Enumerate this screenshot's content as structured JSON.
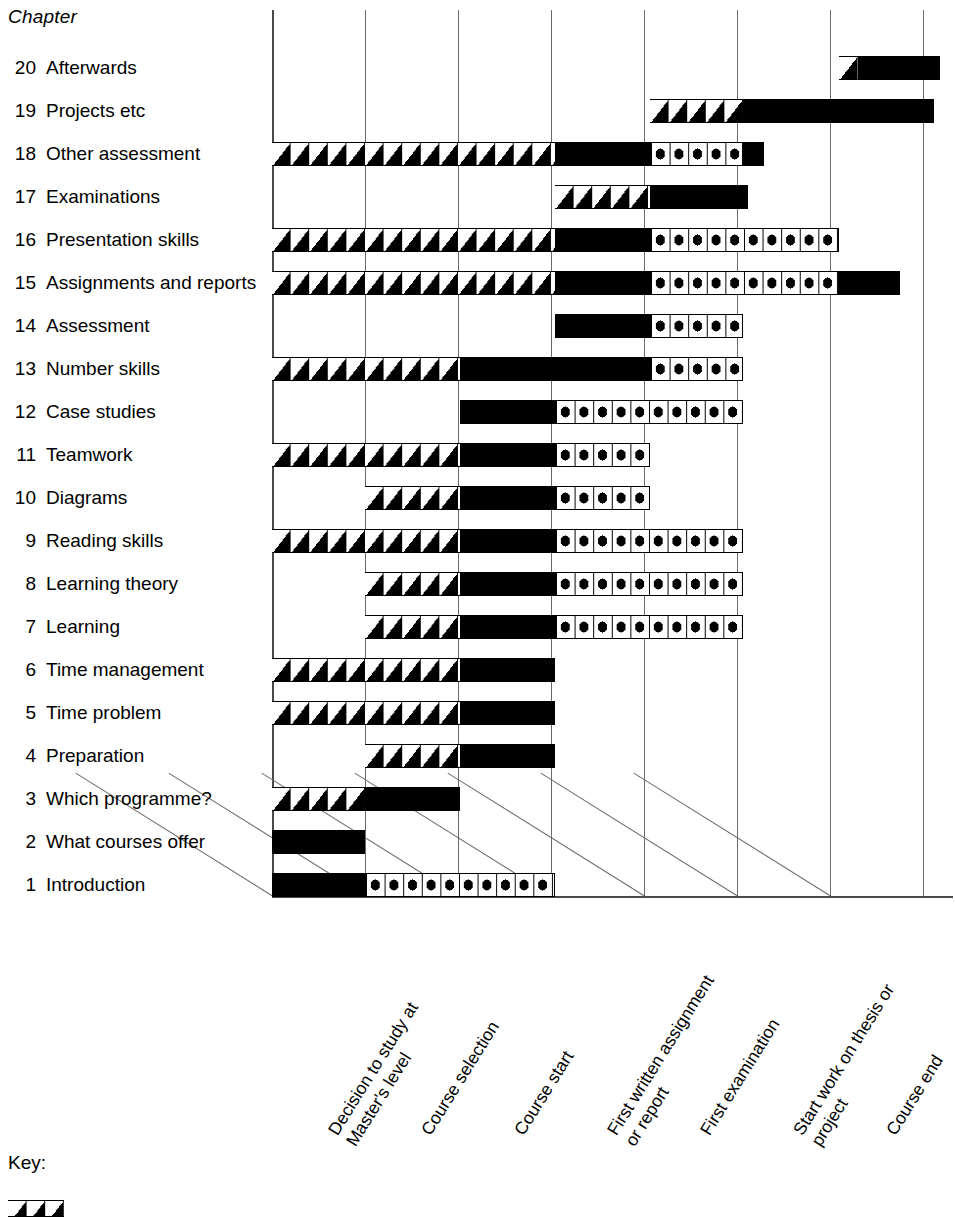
{
  "chart_data": {
    "type": "bar",
    "title": "",
    "xlabel": "",
    "ylabel": "Chapter",
    "axis_title": "Chapter",
    "grid": true,
    "legend_position": "bottom-left",
    "orientation": "horizontal-gantt",
    "milestones": [
      "Decision to study at\nMaster's level",
      "Course selection",
      "Course start",
      "First written assignment\nor report",
      "First examination",
      "Start work on thesis or\nproject",
      "Course end"
    ],
    "milestone_labels": [
      {
        "line1": "Decision to study at",
        "line2": "Master's level"
      },
      {
        "line1": "Course selection",
        "line2": ""
      },
      {
        "line1": "Course start",
        "line2": ""
      },
      {
        "line1": "First written assignment",
        "line2": "or report"
      },
      {
        "line1": "First examination",
        "line2": ""
      },
      {
        "line1": "Start work on thesis or",
        "line2": "project"
      },
      {
        "line1": "Course end",
        "line2": ""
      }
    ],
    "segment_styles": [
      "hatch",
      "solid",
      "dot"
    ],
    "categories": [
      "Afterwards",
      "Projects etc",
      "Other assessment",
      "Examinations",
      "Presentation skills",
      "Assignments and reports",
      "Assessment",
      "Number skills",
      "Case studies",
      "Teamwork",
      "Diagrams",
      "Reading skills",
      "Learning theory",
      "Learning",
      "Time management",
      "Time problem",
      "Preparation",
      "Which programme?",
      "What courses offer",
      "Introduction"
    ],
    "rows": [
      {
        "num": "20",
        "label": "Afterwards",
        "segments": [
          {
            "style": "hatch",
            "start": 6.1,
            "end": 6.3
          },
          {
            "style": "solid",
            "start": 6.3,
            "end": 7.18
          }
        ]
      },
      {
        "num": "19",
        "label": "Projects etc",
        "segments": [
          {
            "style": "hatch",
            "start": 4.06,
            "end": 5.06
          },
          {
            "style": "solid",
            "start": 5.06,
            "end": 7.12
          }
        ]
      },
      {
        "num": "18",
        "label": "Other assessment",
        "segments": [
          {
            "style": "hatch",
            "start": 0.0,
            "end": 3.04
          },
          {
            "style": "solid",
            "start": 3.04,
            "end": 4.06
          },
          {
            "style": "dot",
            "start": 4.06,
            "end": 5.06
          },
          {
            "style": "solid",
            "start": 5.06,
            "end": 5.29
          }
        ]
      },
      {
        "num": "17",
        "label": "Examinations",
        "segments": [
          {
            "style": "hatch",
            "start": 3.04,
            "end": 4.06
          },
          {
            "style": "solid",
            "start": 4.06,
            "end": 5.12
          }
        ]
      },
      {
        "num": "16",
        "label": "Presentation skills",
        "segments": [
          {
            "style": "hatch",
            "start": 0.0,
            "end": 3.04
          },
          {
            "style": "solid",
            "start": 3.04,
            "end": 4.06
          },
          {
            "style": "dot",
            "start": 4.06,
            "end": 6.1
          }
        ]
      },
      {
        "num": "15",
        "label": "Assignments and reports",
        "segments": [
          {
            "style": "hatch",
            "start": 0.0,
            "end": 3.04
          },
          {
            "style": "solid",
            "start": 3.04,
            "end": 4.06
          },
          {
            "style": "dot",
            "start": 4.06,
            "end": 6.1
          },
          {
            "style": "solid",
            "start": 6.1,
            "end": 6.75
          }
        ]
      },
      {
        "num": "14",
        "label": "Assessment",
        "segments": [
          {
            "style": "solid",
            "start": 3.04,
            "end": 4.06
          },
          {
            "style": "dot",
            "start": 4.06,
            "end": 5.06
          }
        ]
      },
      {
        "num": "13",
        "label": "Number skills",
        "segments": [
          {
            "style": "hatch",
            "start": 0.0,
            "end": 2.02
          },
          {
            "style": "solid",
            "start": 2.02,
            "end": 4.06
          },
          {
            "style": "dot",
            "start": 4.06,
            "end": 5.06
          }
        ]
      },
      {
        "num": "12",
        "label": "Case studies",
        "segments": [
          {
            "style": "solid",
            "start": 2.02,
            "end": 3.04
          },
          {
            "style": "dot",
            "start": 3.04,
            "end": 5.06
          }
        ]
      },
      {
        "num": "11",
        "label": "Teamwork",
        "segments": [
          {
            "style": "hatch",
            "start": 0.0,
            "end": 2.02
          },
          {
            "style": "solid",
            "start": 2.02,
            "end": 3.04
          },
          {
            "style": "dot",
            "start": 3.04,
            "end": 4.06
          }
        ]
      },
      {
        "num": "10",
        "label": "Diagrams",
        "segments": [
          {
            "style": "hatch",
            "start": 1.0,
            "end": 2.02
          },
          {
            "style": "solid",
            "start": 2.02,
            "end": 3.04
          },
          {
            "style": "dot",
            "start": 3.04,
            "end": 4.06
          }
        ]
      },
      {
        "num": "9",
        "label": "Reading skills",
        "segments": [
          {
            "style": "hatch",
            "start": 0.0,
            "end": 2.02
          },
          {
            "style": "solid",
            "start": 2.02,
            "end": 3.04
          },
          {
            "style": "dot",
            "start": 3.04,
            "end": 5.06
          }
        ]
      },
      {
        "num": "8",
        "label": "Learning theory",
        "segments": [
          {
            "style": "hatch",
            "start": 1.0,
            "end": 2.02
          },
          {
            "style": "solid",
            "start": 2.02,
            "end": 3.04
          },
          {
            "style": "dot",
            "start": 3.04,
            "end": 5.06
          }
        ]
      },
      {
        "num": "7",
        "label": "Learning",
        "segments": [
          {
            "style": "hatch",
            "start": 1.0,
            "end": 2.02
          },
          {
            "style": "solid",
            "start": 2.02,
            "end": 3.04
          },
          {
            "style": "dot",
            "start": 3.04,
            "end": 5.06
          }
        ]
      },
      {
        "num": "6",
        "label": "Time management",
        "segments": [
          {
            "style": "hatch",
            "start": 0.0,
            "end": 2.02
          },
          {
            "style": "solid",
            "start": 2.02,
            "end": 3.04
          }
        ]
      },
      {
        "num": "5",
        "label": "Time problem",
        "segments": [
          {
            "style": "hatch",
            "start": 0.0,
            "end": 2.02
          },
          {
            "style": "solid",
            "start": 2.02,
            "end": 3.04
          }
        ]
      },
      {
        "num": "4",
        "label": "Preparation",
        "segments": [
          {
            "style": "hatch",
            "start": 1.0,
            "end": 2.02
          },
          {
            "style": "solid",
            "start": 2.02,
            "end": 3.04
          }
        ]
      },
      {
        "num": "3",
        "label": "Which programme?",
        "segments": [
          {
            "style": "hatch",
            "start": 0.0,
            "end": 1.0
          },
          {
            "style": "solid",
            "start": 1.0,
            "end": 2.02
          }
        ]
      },
      {
        "num": "2",
        "label": "What courses offer",
        "segments": [
          {
            "style": "solid",
            "start": 0.0,
            "end": 1.0
          }
        ]
      },
      {
        "num": "1",
        "label": "Introduction",
        "segments": [
          {
            "style": "solid",
            "start": 0.0,
            "end": 1.0
          },
          {
            "style": "dot",
            "start": 1.0,
            "end": 3.04
          }
        ]
      }
    ]
  },
  "key": {
    "title": "Key:"
  }
}
